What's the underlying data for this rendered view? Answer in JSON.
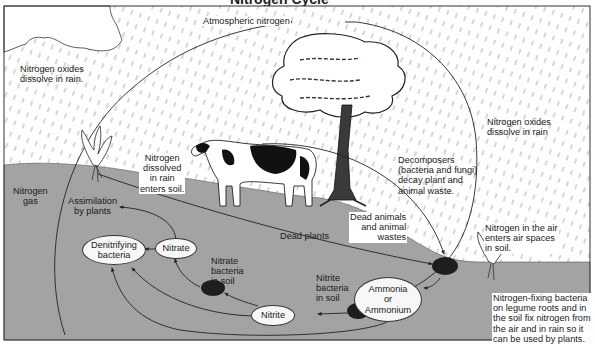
{
  "diagram": {
    "title_fragment": "Nitrogen Cycle",
    "colors": {
      "sky": "#ffffff",
      "soil": "#a3a3a3",
      "rain": "#8a8a8a",
      "line": "#2a2a2a",
      "node_fill": "#f7f7f7",
      "bacteria_clump": "#1e1e1e"
    },
    "labels": {
      "atmospheric_nitrogen": "Atmospheric nitrogen",
      "nitrogen_oxides_left": [
        "Nitrogen oxides",
        "dissolve in rain."
      ],
      "nitrogen_oxides_right": [
        "Nitrogen oxides",
        "dissolve in rain"
      ],
      "nitrogen_gas": [
        "Nitrogen",
        "gas"
      ],
      "assimilation": [
        "Assimilation",
        "by plants"
      ],
      "dissolved_in_rain": [
        "Nitrogen",
        "dissolved",
        "in rain",
        "enters soil."
      ],
      "decomposers": [
        "Decomposers",
        "(bacteria and fungi)",
        "decay plant and",
        "animal waste."
      ],
      "dead_animals": [
        "Dead animals",
        "and animal",
        "wastes"
      ],
      "dead_plants": "Dead plants",
      "nitrogen_in_air": [
        "Nitrogen in the air",
        "enters air spaces",
        "in soil."
      ],
      "nitrogen_fixing": [
        "Nitrogen-fixing bacteria",
        "on legume roots and in",
        "the soil fix nitrogen from",
        "the air and in rain so it",
        "can be used by plants."
      ],
      "nitrate_bacteria": [
        "Nitrate",
        "bacteria",
        "in soil"
      ],
      "nitrite_bacteria": [
        "Nitrite",
        "bacteria",
        "in soil"
      ]
    },
    "nodes": {
      "denitrifying": [
        "Denitrifying",
        "bacteria"
      ],
      "nitrate": "Nitrate",
      "nitrite": "Nitrite",
      "ammonia": [
        "Ammonia",
        "or",
        "Ammonium"
      ]
    }
  }
}
